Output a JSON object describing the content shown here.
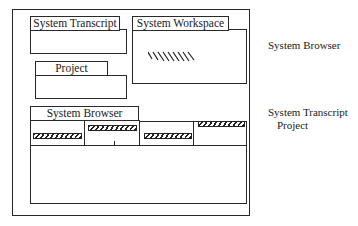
{
  "windows": {
    "transcript": {
      "title": "System Transcript"
    },
    "workspace": {
      "title": "System Workspace"
    },
    "project": {
      "title": "Project"
    },
    "browser": {
      "title": "System Browser"
    }
  },
  "side_labels": {
    "upper": "System Browser",
    "lower_line1": "System Transcript",
    "lower_line2": "Project"
  }
}
